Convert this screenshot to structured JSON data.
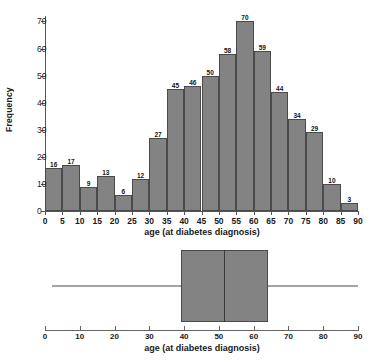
{
  "chart_data": [
    {
      "type": "bar",
      "title": "",
      "xlabel": "age (at diabetes diagnosis)",
      "ylabel": "Frequency",
      "categories": [
        "0-5",
        "5-10",
        "10-15",
        "15-20",
        "20-25",
        "25-30",
        "30-35",
        "35-40",
        "40-45",
        "45-50",
        "50-55",
        "55-60",
        "60-65",
        "65-70",
        "70-75",
        "75-80",
        "80-85",
        "85-90"
      ],
      "bin_starts": [
        0,
        5,
        10,
        15,
        20,
        25,
        30,
        35,
        40,
        45,
        50,
        55,
        60,
        65,
        70,
        75,
        80,
        85
      ],
      "bin_width": 5,
      "values": [
        16,
        17,
        9,
        13,
        6,
        12,
        27,
        45,
        46,
        50,
        58,
        70,
        59,
        44,
        34,
        29,
        10,
        3
      ],
      "bar_labels": [
        "16",
        "17",
        "9",
        "13",
        "6",
        "12",
        "27",
        "45",
        "46",
        "50",
        "58",
        "70",
        "59",
        "44",
        "34",
        "29",
        "10",
        "3"
      ],
      "xlim": [
        0,
        90
      ],
      "ylim": [
        0,
        72
      ],
      "xticks": [
        0,
        5,
        10,
        15,
        20,
        25,
        30,
        35,
        40,
        45,
        50,
        55,
        60,
        65,
        70,
        75,
        80,
        85,
        90
      ],
      "xtick_labels": [
        "0",
        "5",
        "10",
        "15",
        "20",
        "25",
        "30",
        "35",
        "40",
        "45",
        "50",
        "55",
        "60",
        "65",
        "70",
        "75",
        "80",
        "85",
        "90"
      ],
      "yticks": [
        0,
        10,
        20,
        30,
        40,
        50,
        60,
        70
      ],
      "ytick_labels": [
        "0",
        "10",
        "20",
        "30",
        "40",
        "50",
        "60",
        "70"
      ],
      "grid": false,
      "legend": false,
      "bar_color": "#838383",
      "bar_edge_color": "#4a4a4a"
    },
    {
      "type": "boxplot",
      "title": "",
      "xlabel": "age (at diabetes diagnosis)",
      "ylabel": "",
      "orientation": "horizontal",
      "whisker_min": 2,
      "q1": 39,
      "median": 51.5,
      "q3": 64,
      "whisker_max": 90,
      "outliers": [],
      "xlim": [
        0,
        90
      ],
      "xticks": [
        0,
        10,
        20,
        30,
        40,
        50,
        60,
        70,
        80,
        90
      ],
      "xtick_labels": [
        "0",
        "10",
        "20",
        "30",
        "40",
        "50",
        "60",
        "70",
        "80",
        "90"
      ],
      "grid": false,
      "legend": false,
      "box_color": "#838383",
      "box_edge_color": "#4a4a4a"
    }
  ]
}
